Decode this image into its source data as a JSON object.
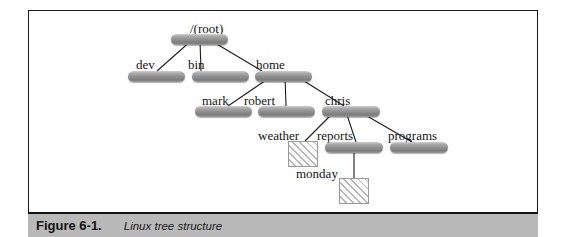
{
  "figure": {
    "caption_number": "Figure 6-1.",
    "caption_text": "Linux tree structure",
    "frame_color": "#1a1a1a",
    "caption_bar_color": "#b9b9b9",
    "background_color": "#ffffff"
  },
  "diagram": {
    "title": "Linux tree structure",
    "type": "tree",
    "node_kinds": {
      "directory": "rounded-gray-bar",
      "file": "hatched-square"
    },
    "nodes": [
      {
        "id": "root",
        "label": "/(root)",
        "kind": "directory",
        "level": 0,
        "label_x": 190,
        "label_y": 22,
        "bar_x": 171,
        "bar_y": 34,
        "bar_w": 57
      },
      {
        "id": "dev",
        "label": "dev",
        "kind": "directory",
        "level": 1,
        "label_x": 136,
        "label_y": 58,
        "bar_x": 128,
        "bar_y": 71,
        "bar_w": 57
      },
      {
        "id": "bin",
        "label": "bin",
        "kind": "directory",
        "level": 1,
        "label_x": 188,
        "label_y": 58,
        "bar_x": 192,
        "bar_y": 71,
        "bar_w": 57
      },
      {
        "id": "home",
        "label": "home",
        "kind": "directory",
        "level": 1,
        "label_x": 256,
        "label_y": 58,
        "bar_x": 255,
        "bar_y": 71,
        "bar_w": 57
      },
      {
        "id": "mark",
        "label": "mark",
        "kind": "directory",
        "level": 2,
        "label_x": 202,
        "label_y": 94,
        "bar_x": 195,
        "bar_y": 106,
        "bar_w": 57
      },
      {
        "id": "robert",
        "label": "robert",
        "kind": "directory",
        "level": 2,
        "label_x": 244,
        "label_y": 94,
        "bar_x": 258,
        "bar_y": 106,
        "bar_w": 57
      },
      {
        "id": "chris",
        "label": "chris",
        "kind": "directory",
        "level": 2,
        "label_x": 325,
        "label_y": 94,
        "bar_x": 322,
        "bar_y": 106,
        "bar_w": 58
      },
      {
        "id": "weather",
        "label": "weather",
        "kind": "file",
        "level": 3,
        "label_x": 258,
        "label_y": 129,
        "bar_x": 288,
        "bar_y": 141,
        "bar_w": 30
      },
      {
        "id": "reports",
        "label": "reports",
        "kind": "directory",
        "level": 3,
        "label_x": 317,
        "label_y": 129,
        "bar_x": 325,
        "bar_y": 142,
        "bar_w": 58
      },
      {
        "id": "programs",
        "label": "programs",
        "kind": "directory",
        "level": 3,
        "label_x": 388,
        "label_y": 129,
        "bar_x": 390,
        "bar_y": 142,
        "bar_w": 58
      },
      {
        "id": "monday",
        "label": "monday",
        "kind": "file",
        "level": 4,
        "label_x": 296,
        "label_y": 167,
        "bar_x": 339,
        "bar_y": 178,
        "bar_w": 30
      }
    ],
    "edges": [
      {
        "from": "root",
        "to": "dev"
      },
      {
        "from": "root",
        "to": "bin"
      },
      {
        "from": "root",
        "to": "home"
      },
      {
        "from": "home",
        "to": "mark"
      },
      {
        "from": "home",
        "to": "robert"
      },
      {
        "from": "home",
        "to": "chris"
      },
      {
        "from": "chris",
        "to": "weather"
      },
      {
        "from": "chris",
        "to": "reports"
      },
      {
        "from": "chris",
        "to": "programs"
      },
      {
        "from": "reports",
        "to": "monday"
      }
    ]
  }
}
